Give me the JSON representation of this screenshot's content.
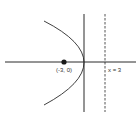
{
  "diagram": {
    "type": "parabola",
    "equation": "y^2 = -12x",
    "focus": {
      "x": -3,
      "y": 0,
      "label": "(-3, 0)"
    },
    "vertex": {
      "x": 0,
      "y": 0
    },
    "directrix": {
      "x": 3,
      "label": "x = 3",
      "style": "dashed"
    },
    "opens": "left",
    "colors": {
      "stroke": "#2a2a2a",
      "background": "#ffffff"
    }
  }
}
